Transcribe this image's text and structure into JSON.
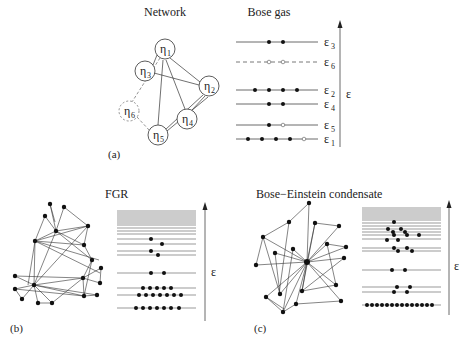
{
  "panel_a": {
    "network_title": "Network",
    "bose_title": "Bose gas",
    "label": "(a)",
    "nodes": [
      {
        "id": "eta1",
        "sym": "η",
        "sub": "1",
        "x": 165,
        "y": 49,
        "dashed": false
      },
      {
        "id": "eta2",
        "sym": "η",
        "sub": "2",
        "x": 209,
        "y": 86,
        "dashed": false
      },
      {
        "id": "eta3",
        "sym": "η",
        "sub": "3",
        "x": 145,
        "y": 71,
        "dashed": false
      },
      {
        "id": "eta4",
        "sym": "η",
        "sub": "4",
        "x": 187,
        "y": 119,
        "dashed": false
      },
      {
        "id": "eta5",
        "sym": "η",
        "sub": "5",
        "x": 158,
        "y": 135,
        "dashed": false
      },
      {
        "id": "eta6",
        "sym": "η",
        "sub": "6",
        "x": 129,
        "y": 111,
        "dashed": true
      }
    ],
    "levels": [
      {
        "name": "ε",
        "sub": "3",
        "y": 42,
        "dashed": false,
        "filled": 2,
        "empty": 0
      },
      {
        "name": "ε",
        "sub": "6",
        "y": 62,
        "dashed": true,
        "filled": 0,
        "empty": 2
      },
      {
        "name": "ε",
        "sub": "2",
        "y": 90,
        "dashed": false,
        "filled": 4,
        "empty": 0
      },
      {
        "name": "ε",
        "sub": "4",
        "y": 104,
        "dashed": false,
        "filled": 2,
        "empty": 0
      },
      {
        "name": "ε",
        "sub": "5",
        "y": 125,
        "dashed": false,
        "filled": 1,
        "empty": 1
      },
      {
        "name": "ε",
        "sub": "1",
        "y": 139,
        "dashed": false,
        "filled": 4,
        "empty": 1
      }
    ],
    "axis_label": "ε"
  },
  "panel_b": {
    "title": "FGR",
    "label": "(b)",
    "axis_label": "ε"
  },
  "panel_c": {
    "title": "Bose−Einstein condensate",
    "label": "(c)",
    "axis_label": "ε"
  }
}
